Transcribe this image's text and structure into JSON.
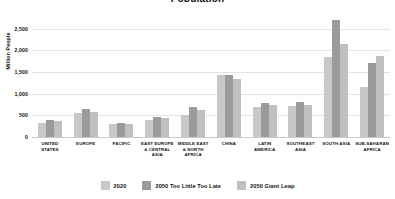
{
  "chart_data": {
    "type": "bar",
    "title": "Population",
    "xlabel": "",
    "ylabel": "Million People",
    "ylim": [
      0,
      2750
    ],
    "yticks": [
      0,
      500,
      1000,
      1500,
      2000,
      2500
    ],
    "ytick_labels": [
      "0",
      "500",
      "1,000",
      "1,500",
      "2,000",
      "2,500"
    ],
    "grid": true,
    "legend_position": "bottom",
    "categories": [
      "UNITED STATES",
      "EUROPE",
      "PACIFIC",
      "EAST EUROPE & CENTRAL ASIA",
      "MIDDLE EAST & NORTH AFRICA",
      "CHINA",
      "LATIN AMERICA",
      "SOUTHEAST ASIA",
      "SOUTH ASIA",
      "SUB-SAHARAN AFRICA"
    ],
    "series": [
      {
        "name": "2020",
        "color": "#c8c8c8",
        "values": [
          335,
          555,
          300,
          400,
          520,
          1440,
          700,
          710,
          1850,
          1150
        ]
      },
      {
        "name": "2050 Too Little Too Late",
        "color": "#9b9b9b",
        "values": [
          400,
          650,
          330,
          470,
          700,
          1440,
          790,
          800,
          2700,
          1700
        ]
      },
      {
        "name": "2050 Giant Leap",
        "color": "#c0c0c0",
        "values": [
          375,
          580,
          310,
          430,
          620,
          1350,
          740,
          745,
          2150,
          1880
        ]
      }
    ]
  },
  "legend": {
    "items": [
      {
        "label": "2020",
        "color": "#c8c8c8"
      },
      {
        "label": "2050 Too Little Too Late",
        "color": "#9b9b9b"
      },
      {
        "label": "2050 Giant Leap",
        "color": "#c0c0c0"
      }
    ]
  }
}
